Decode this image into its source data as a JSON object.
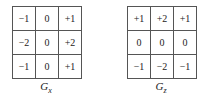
{
  "kernels": [
    {
      "name": "G",
      "subscript": "x",
      "rows": [
        [
          "−1",
          "0",
          "+1"
        ],
        [
          "−2",
          "0",
          "+2"
        ],
        [
          "−1",
          "0",
          "+1"
        ]
      ]
    },
    {
      "name": "G",
      "subscript": "z",
      "rows": [
        [
          "+1",
          "+2",
          "+1"
        ],
        [
          "0",
          "0",
          "0"
        ],
        [
          "−1",
          "−2",
          "−1"
        ]
      ]
    }
  ]
}
